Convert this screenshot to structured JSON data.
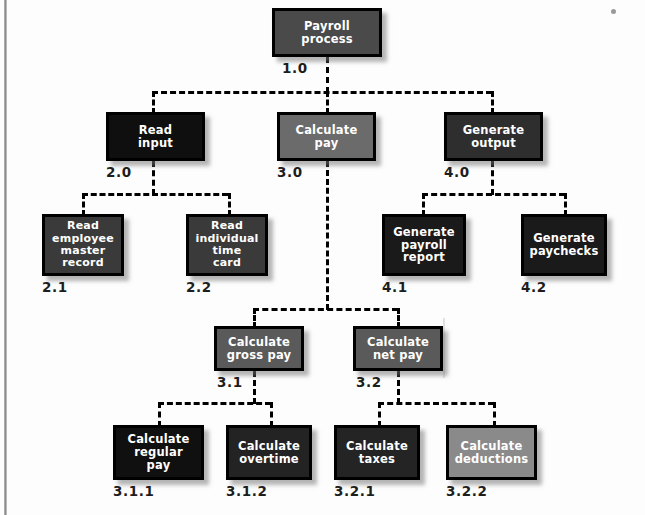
{
  "diagram": {
    "type": "hierarchy-structure-chart",
    "background_color": "#fdfdfd",
    "connector_color": "#000000",
    "connector_style": "dashed",
    "label_color": "#1d1d1d",
    "node_text_color": "#ffffff",
    "node_border_color": "#000000"
  },
  "nodes": [
    {
      "id": "n1",
      "ref": "1.0",
      "label": "Payroll\nprocess",
      "level": 0,
      "fill": "#4a4a4a",
      "x": 272,
      "y": 8,
      "w": 110,
      "h": 49,
      "ref_x": 282,
      "ref_y": 60
    },
    {
      "id": "n2",
      "ref": "2.0",
      "label": "Read\ninput",
      "level": 1,
      "fill": "#0f0f0f",
      "x": 106,
      "y": 112,
      "w": 99,
      "h": 49,
      "ref_x": 106,
      "ref_y": 164
    },
    {
      "id": "n3",
      "ref": "3.0",
      "label": "Calculate\npay",
      "level": 1,
      "fill": "#6b6b6b",
      "x": 277,
      "y": 112,
      "w": 99,
      "h": 49,
      "ref_x": 277,
      "ref_y": 164
    },
    {
      "id": "n4",
      "ref": "4.0",
      "label": "Generate\noutput",
      "level": 1,
      "fill": "#2e2e2e",
      "x": 444,
      "y": 112,
      "w": 99,
      "h": 49,
      "ref_x": 444,
      "ref_y": 164
    },
    {
      "id": "n21",
      "ref": "2.1",
      "label": "Read\nemployee\nmaster\nrecord",
      "level": 2,
      "fill": "#3a3a3a",
      "x": 42,
      "y": 214,
      "w": 82,
      "h": 62,
      "ref_x": 42,
      "ref_y": 279
    },
    {
      "id": "n22",
      "ref": "2.2",
      "label": "Read\nindividual\ntime\ncard",
      "level": 2,
      "fill": "#3a3a3a",
      "x": 186,
      "y": 214,
      "w": 82,
      "h": 62,
      "ref_x": 186,
      "ref_y": 279
    },
    {
      "id": "n41",
      "ref": "4.1",
      "label": "Generate\npayroll\nreport",
      "level": 2,
      "fill": "#1a1a1a",
      "x": 382,
      "y": 214,
      "w": 84,
      "h": 62,
      "ref_x": 382,
      "ref_y": 279
    },
    {
      "id": "n42",
      "ref": "4.2",
      "label": "Generate\npaychecks",
      "level": 2,
      "fill": "#1a1a1a",
      "x": 521,
      "y": 214,
      "w": 86,
      "h": 62,
      "ref_x": 521,
      "ref_y": 279
    },
    {
      "id": "n31",
      "ref": "3.1",
      "label": "Calculate\ngross pay",
      "level": 2,
      "fill": "#5a5a5a",
      "x": 214,
      "y": 326,
      "w": 90,
      "h": 45,
      "ref_x": 217,
      "ref_y": 374
    },
    {
      "id": "n32",
      "ref": "3.2",
      "label": "Calculate\nnet pay",
      "level": 2,
      "fill": "#5a5a5a",
      "x": 353,
      "y": 326,
      "w": 90,
      "h": 45,
      "ref_x": 356,
      "ref_y": 374
    },
    {
      "id": "n311",
      "ref": "3.1.1",
      "label": "Calculate\nregular\npay",
      "level": 3,
      "fill": "#101010",
      "x": 113,
      "y": 425,
      "w": 91,
      "h": 55,
      "ref_x": 113,
      "ref_y": 483
    },
    {
      "id": "n312",
      "ref": "3.1.2",
      "label": "Calculate\novertime",
      "level": 3,
      "fill": "#232323",
      "x": 226,
      "y": 425,
      "w": 86,
      "h": 55,
      "ref_x": 226,
      "ref_y": 483
    },
    {
      "id": "n321",
      "ref": "3.2.1",
      "label": "Calculate\ntaxes",
      "level": 3,
      "fill": "#242424",
      "x": 334,
      "y": 425,
      "w": 86,
      "h": 55,
      "ref_x": 334,
      "ref_y": 483
    },
    {
      "id": "n322",
      "ref": "3.2.2",
      "label": "Calculate\ndeductions",
      "level": 3,
      "fill": "#8a8a8a",
      "x": 446,
      "y": 425,
      "w": 91,
      "h": 55,
      "ref_x": 446,
      "ref_y": 483
    }
  ],
  "connectors": {
    "buses": [
      {
        "name": "root-bus",
        "x": 152,
        "y": 91,
        "w": 340
      },
      {
        "name": "read-bus",
        "x": 82,
        "y": 193,
        "w": 146
      },
      {
        "name": "gen-bus",
        "x": 422,
        "y": 193,
        "w": 143
      },
      {
        "name": "calc-bus",
        "x": 253,
        "y": 308,
        "w": 145
      },
      {
        "name": "gross-bus",
        "x": 158,
        "y": 402,
        "w": 113
      },
      {
        "name": "net-bus",
        "x": 378,
        "y": 402,
        "w": 116
      }
    ],
    "verticals": [
      {
        "name": "root-down",
        "x": 326,
        "y": 57,
        "h": 36
      },
      {
        "name": "read-drop",
        "x": 152,
        "y": 91,
        "h": 23
      },
      {
        "name": "calc-drop",
        "x": 326,
        "y": 91,
        "h": 23
      },
      {
        "name": "gen-drop",
        "x": 491,
        "y": 91,
        "h": 23
      },
      {
        "name": "read-in-down",
        "x": 152,
        "y": 161,
        "h": 34
      },
      {
        "name": "calc-long-down",
        "x": 326,
        "y": 161,
        "h": 149
      },
      {
        "name": "gen-out-down",
        "x": 491,
        "y": 161,
        "h": 34
      },
      {
        "name": "emp-drop",
        "x": 82,
        "y": 193,
        "h": 23
      },
      {
        "name": "time-drop",
        "x": 228,
        "y": 193,
        "h": 23
      },
      {
        "name": "report-drop",
        "x": 422,
        "y": 193,
        "h": 23
      },
      {
        "name": "checks-drop",
        "x": 564,
        "y": 193,
        "h": 23
      },
      {
        "name": "gross-drop",
        "x": 253,
        "y": 308,
        "h": 20
      },
      {
        "name": "net-drop",
        "x": 397,
        "y": 308,
        "h": 20
      },
      {
        "name": "gross-down",
        "x": 253,
        "y": 371,
        "h": 33
      },
      {
        "name": "net-down",
        "x": 397,
        "y": 371,
        "h": 33
      },
      {
        "name": "reg-drop",
        "x": 158,
        "y": 402,
        "h": 25
      },
      {
        "name": "ot-drop",
        "x": 270,
        "y": 402,
        "h": 25
      },
      {
        "name": "tax-drop",
        "x": 378,
        "y": 402,
        "h": 25
      },
      {
        "name": "ded-drop",
        "x": 493,
        "y": 402,
        "h": 25
      }
    ]
  }
}
